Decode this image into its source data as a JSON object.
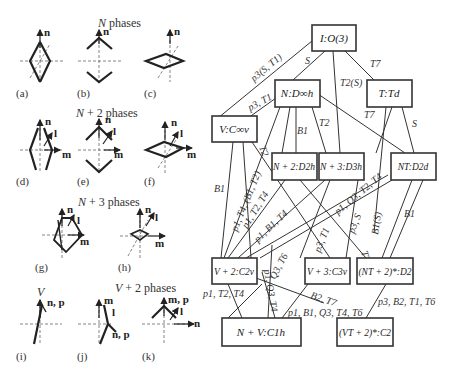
{
  "left_panel": {
    "headings": {
      "n_phases": "N phases",
      "n2_phases": "N + 2 phases",
      "n3_phases": "N + 3 phases",
      "v_label": "V",
      "v2_phases": "V + 2 phases"
    },
    "panels": [
      {
        "id": "a",
        "caption": "(a)",
        "axes": [
          "n"
        ]
      },
      {
        "id": "b",
        "caption": "(b)",
        "axes": [
          "n"
        ]
      },
      {
        "id": "c",
        "caption": "(c)",
        "axes": [
          "n"
        ]
      },
      {
        "id": "d",
        "caption": "(d)",
        "axes": [
          "n",
          "l",
          "m"
        ]
      },
      {
        "id": "e",
        "caption": "(e)",
        "axes": [
          "n",
          "l",
          "m"
        ]
      },
      {
        "id": "f",
        "caption": "(f)",
        "axes": [
          "n",
          "l",
          "m"
        ]
      },
      {
        "id": "g",
        "caption": "(g)",
        "axes": [
          "n",
          "l",
          "m"
        ]
      },
      {
        "id": "h",
        "caption": "(h)",
        "axes": [
          "n",
          "l",
          "m"
        ]
      },
      {
        "id": "i",
        "caption": "(i)",
        "axes": [
          "n, p"
        ]
      },
      {
        "id": "j",
        "caption": "(j)",
        "axes": [
          "m",
          "l",
          "n, p"
        ]
      },
      {
        "id": "k",
        "caption": "(k)",
        "axes": [
          "m, p",
          "l",
          "n"
        ]
      }
    ]
  },
  "graph": {
    "nodes": [
      {
        "id": "I",
        "label": "I:O(3)"
      },
      {
        "id": "N",
        "label": "N:D∞h"
      },
      {
        "id": "T",
        "label": "T:Td"
      },
      {
        "id": "V",
        "label": "V:C∞v"
      },
      {
        "id": "N2",
        "label": "N + 2:D2h"
      },
      {
        "id": "N3",
        "label": "N + 3:D3h"
      },
      {
        "id": "NT",
        "label": "NT:D2d"
      },
      {
        "id": "V2",
        "label": "V + 2:C2v"
      },
      {
        "id": "V3",
        "label": "V + 3:C3v"
      },
      {
        "id": "NT2",
        "label": "(NT + 2)*:D2"
      },
      {
        "id": "NV",
        "label": "N + V:C1h"
      },
      {
        "id": "VT2",
        "label": "(VT + 2)*:C2"
      }
    ],
    "edge_labels": {
      "I_V": "p3(S, T1)",
      "I_N": "S",
      "I_N3": "T2(S)",
      "I_T": "T7",
      "N_V": "p3, T1",
      "N_N2": "B1",
      "N_N3": "T2",
      "N_NT": "T7",
      "T_NT": "S",
      "V_V2": "B1",
      "V_T2": "T2",
      "V_V2b": "p1, T4, (B1, T2)",
      "N2_V2": "p1, T2, T4",
      "N3_V2": "p1, B1, T4",
      "N3_V3": "p3, T1",
      "NT_V3": "p1, Q3, T2, T4",
      "NT_V3b": "p3, S",
      "NT_NT2": "B1(S)",
      "T_NT2": "B1",
      "V3_NT2": "T7",
      "V2_NV": "p1, T2, T4",
      "NV_a": "p1, Q3, T4",
      "NV_b": "Q3, T6",
      "V2_VT2": "B2, T7",
      "V3_NV": "p1, B1, Q3, T4, T6",
      "NT2_VT2": "p3, B2, T1, T6"
    }
  }
}
